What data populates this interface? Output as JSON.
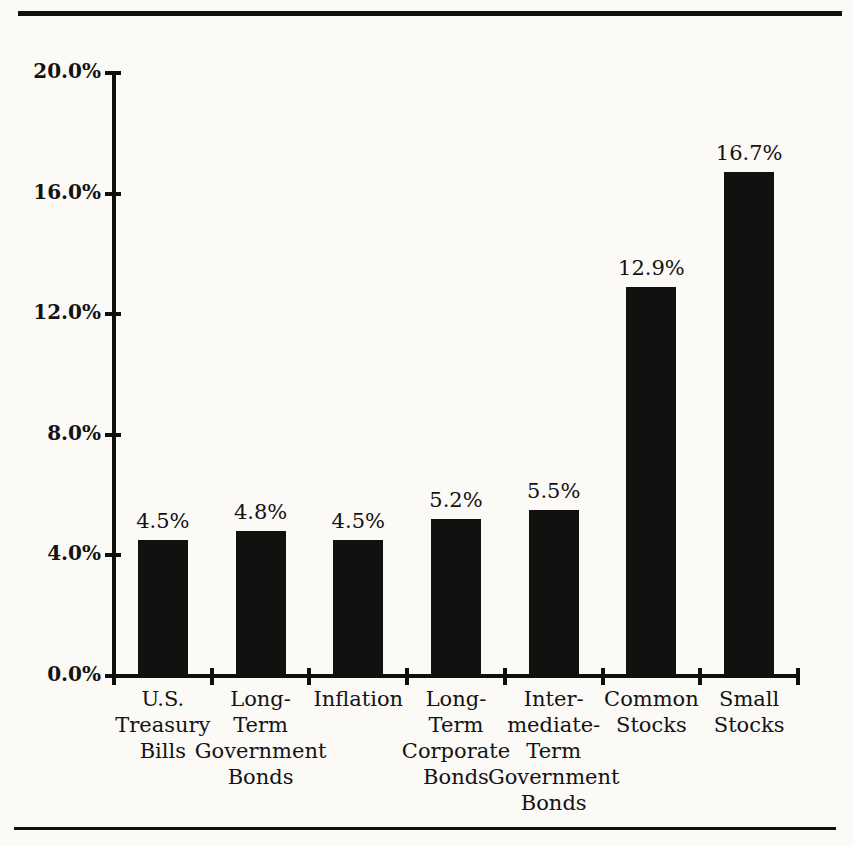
{
  "figure": {
    "background_color": "#fbfaf7",
    "ink_color": "#131110",
    "rules": {
      "top": "horizontal-rule",
      "bottom": "horizontal-rule"
    }
  },
  "chart_data": {
    "type": "bar",
    "title": "",
    "subtitle": "",
    "xlabel": "",
    "ylabel": "",
    "ylim": [
      0,
      20
    ],
    "grid": false,
    "legend": null,
    "orientation": "vertical",
    "bar_color": "#131110",
    "units": "percent",
    "categories": [
      "U.S. Treasury Bills",
      "Long-Term Government Bonds",
      "Inflation",
      "Long-Term Corporate Bonds",
      "Intermediate-Term Government Bonds",
      "Common Stocks",
      "Small Stocks"
    ],
    "category_lines": [
      [
        "U.S.",
        "Treasury",
        "Bills"
      ],
      [
        "Long-",
        "Term",
        "Government",
        "Bonds"
      ],
      [
        "Inflation"
      ],
      [
        "Long-",
        "Term",
        "Corporate",
        "Bonds"
      ],
      [
        "Inter-",
        "mediate-",
        "Term",
        "Government",
        "Bonds"
      ],
      [
        "Common",
        "Stocks"
      ],
      [
        "Small",
        "Stocks"
      ]
    ],
    "values": [
      4.5,
      4.8,
      4.5,
      5.2,
      5.5,
      12.9,
      16.7
    ],
    "value_labels": [
      "4.5%",
      "4.8%",
      "4.5%",
      "5.2%",
      "5.5%",
      "12.9%",
      "16.7%"
    ],
    "ytick_values": [
      0.0,
      4.0,
      8.0,
      12.0,
      16.0,
      20.0
    ],
    "ytick_labels": [
      "0.0%",
      "4.0%",
      "8.0%",
      "12.0%",
      "16.0%",
      "20.0%"
    ]
  }
}
